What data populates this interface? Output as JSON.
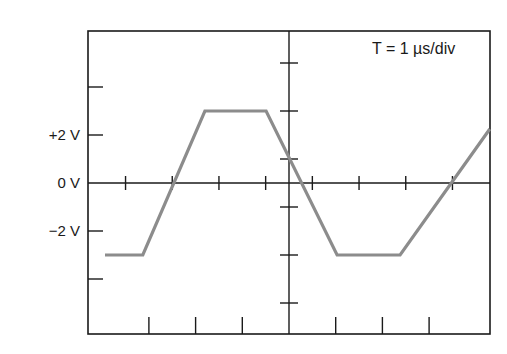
{
  "chart_data": {
    "type": "line",
    "title": "",
    "annotation": "T = 1 µs/div",
    "xlabel": "time (µs, 1 µs/div, 0 at center graticule)",
    "ylabel": "Voltage (V)",
    "y_tick_labels": [
      "+2 V",
      "0 V",
      "−2 V"
    ],
    "y_tick_values": [
      2,
      0,
      -2
    ],
    "xlim": [
      -4.3,
      4.3
    ],
    "ylim": [
      -6.3,
      6.3
    ],
    "grid": false,
    "legend": null,
    "series": [
      {
        "name": "waveform",
        "color": "#8c8c8c",
        "x": [
          -3.94,
          -3.13,
          -1.8,
          -0.49,
          1.03,
          2.38,
          4.3
        ],
        "y": [
          -3,
          -3,
          3,
          3,
          -3,
          -3,
          2.25
        ]
      }
    ]
  },
  "labels": {
    "y_plus2": "+2 V",
    "y_zero": "0 V",
    "y_minus2": "−2 V",
    "timebase": "T = 1 µs/div"
  },
  "colors": {
    "frame": "#1a1a1a",
    "trace": "#8c8c8c",
    "background": "#ffffff"
  }
}
